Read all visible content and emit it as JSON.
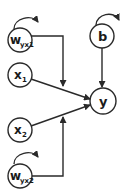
{
  "diagram": {
    "type": "graphical-model",
    "nodes": [
      {
        "id": "wyx1",
        "label": "w",
        "subscript": "yx1",
        "self_loop": true
      },
      {
        "id": "b",
        "label": "b",
        "subscript": "",
        "self_loop": true
      },
      {
        "id": "x1",
        "label": "x",
        "subscript": "1",
        "self_loop": false
      },
      {
        "id": "y",
        "label": "y",
        "subscript": "",
        "self_loop": false
      },
      {
        "id": "x2",
        "label": "x",
        "subscript": "2",
        "self_loop": false
      },
      {
        "id": "wyx2",
        "label": "w",
        "subscript": "yx2",
        "self_loop": true
      }
    ],
    "edges": [
      {
        "from": "x1",
        "to": "y"
      },
      {
        "from": "x2",
        "to": "y"
      },
      {
        "from": "b",
        "to": "y"
      },
      {
        "from": "wyx1",
        "to": "x1->y",
        "kind": "modulates"
      },
      {
        "from": "wyx2",
        "to": "x2->y",
        "kind": "modulates"
      }
    ],
    "colors": {
      "stroke": "#2a2a2a",
      "fill": "#ffffff",
      "text": "#1a1a1a"
    }
  }
}
